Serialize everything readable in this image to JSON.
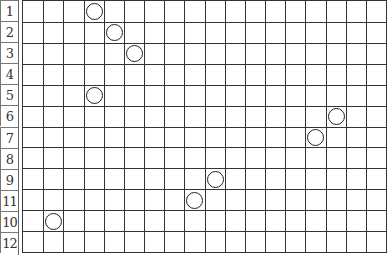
{
  "grid": {
    "rows": 12,
    "cols": 18,
    "row_labels": [
      "1",
      "2",
      "3",
      "4",
      "5",
      "6",
      "7",
      "8",
      "9",
      "11",
      "10",
      "12"
    ]
  },
  "markers": [
    {
      "row": 0,
      "col": 3
    },
    {
      "row": 1,
      "col": 4
    },
    {
      "row": 2,
      "col": 5
    },
    {
      "row": 4,
      "col": 3
    },
    {
      "row": 5,
      "col": 15
    },
    {
      "row": 6,
      "col": 14
    },
    {
      "row": 8,
      "col": 9
    },
    {
      "row": 9,
      "col": 8
    },
    {
      "row": 10,
      "col": 1
    }
  ],
  "colors": {
    "line": "#333333",
    "marker": "#222222",
    "background": "#ffffff"
  }
}
